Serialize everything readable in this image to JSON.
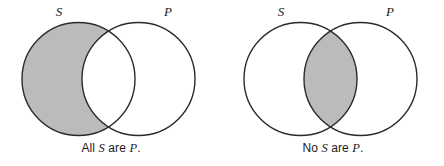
{
  "figure": {
    "type": "venn-diagram-pair",
    "background_color": "#ffffff",
    "stroke_color": "#2b2b2b",
    "shade_color": "#bbbbbb",
    "unshaded_color": "#ffffff"
  },
  "diagrams": [
    {
      "id": "all-s-are-p",
      "caption_prefix": "All ",
      "caption_subject": "S",
      "caption_middle": " are ",
      "caption_predicate": "P",
      "caption_suffix": ".",
      "caption_full": "All S are P.",
      "left_circle_label": "S",
      "right_circle_label": "P",
      "shaded_region": "left-circle-only",
      "shaded_region_description": "The portion of S that lies outside P is shaded.",
      "meaning": "Universal affirmative: every S is a P."
    },
    {
      "id": "no-s-are-p",
      "caption_prefix": "No ",
      "caption_subject": "S",
      "caption_middle": " are ",
      "caption_predicate": "P",
      "caption_suffix": ".",
      "caption_full": "No S are P.",
      "left_circle_label": "S",
      "right_circle_label": "P",
      "shaded_region": "intersection",
      "shaded_region_description": "The lens-shaped overlap of S and P is shaded.",
      "meaning": "Universal negative: no S is a P."
    }
  ],
  "geometry": {
    "circle_radius": 56.5,
    "left_circle_center_x": 78.5,
    "right_circle_center_x": 138.5,
    "circle_center_y": 79,
    "stroke_width": 1.4
  }
}
